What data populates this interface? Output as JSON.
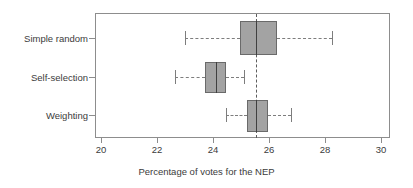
{
  "chart_data": {
    "type": "box",
    "title": "",
    "xlabel": "Percentage of votes for the NEP",
    "ylabel": "",
    "orientation": "horizontal",
    "xlim": [
      19.3,
      30.5
    ],
    "grid": false,
    "legend": "none",
    "x_ticks": [
      20,
      22,
      24,
      26,
      28,
      30
    ],
    "x_tick_labels": [
      "20",
      "22",
      "24",
      "26",
      "28",
      "30"
    ],
    "categories": [
      "Simple random",
      "Self-selection",
      "Weighting"
    ],
    "reference_line": {
      "value": 25.55,
      "style": "dashed",
      "orientation": "vertical"
    },
    "boxes": [
      {
        "category": "Simple random",
        "whisker_low": 23.0,
        "q1": 24.95,
        "median": 25.55,
        "q3": 26.3,
        "whisker_high": 28.25
      },
      {
        "category": "Self-selection",
        "whisker_low": 22.65,
        "q1": 23.7,
        "median": 24.1,
        "q3": 24.45,
        "whisker_high": 25.1
      },
      {
        "category": "Weighting",
        "whisker_low": 24.45,
        "q1": 25.2,
        "median": 25.55,
        "q3": 25.95,
        "whisker_high": 26.8
      }
    ]
  },
  "axis": {
    "x_title": "Percentage of votes for the NEP"
  }
}
